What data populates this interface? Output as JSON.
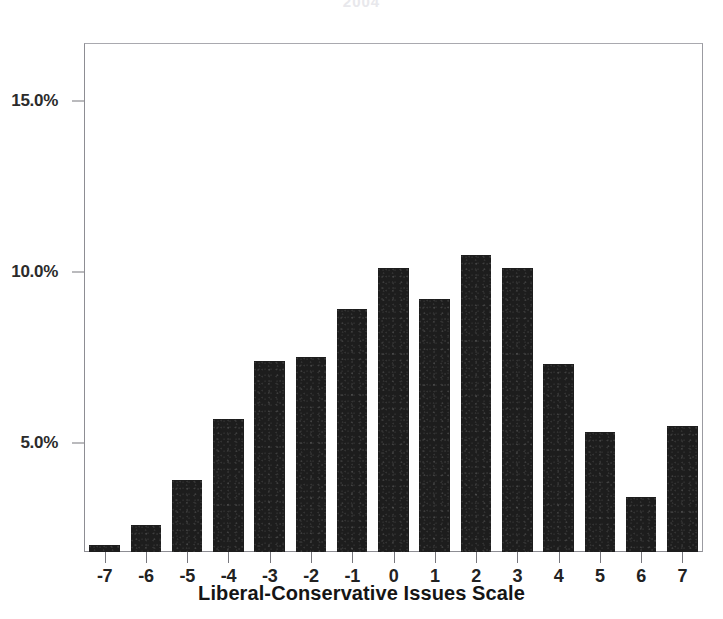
{
  "chart_data": {
    "type": "bar",
    "title": "2004",
    "title_note": "title is cropped off at the top edge of the screenshot and barely legible",
    "xlabel": "Liberal-Conservative Issues Scale",
    "ylabel": "",
    "categories": [
      "-7",
      "-6",
      "-5",
      "-4",
      "-3",
      "-2",
      "-1",
      "0",
      "1",
      "2",
      "3",
      "4",
      "5",
      "6",
      "7"
    ],
    "values": [
      2.0,
      2.6,
      3.9,
      5.7,
      7.4,
      7.5,
      8.9,
      10.1,
      9.2,
      10.5,
      10.1,
      7.3,
      5.3,
      3.4,
      5.5
    ],
    "value_unit": "%",
    "ylim": [
      1.8,
      16.7
    ],
    "y_ticks": [
      5.0,
      10.0,
      15.0
    ],
    "y_tick_labels": [
      "5.0%",
      "10.0%",
      "15.0%"
    ],
    "x_ticks": [
      "-7",
      "-6",
      "-5",
      "-4",
      "-3",
      "-2",
      "-1",
      "0",
      "1",
      "2",
      "3",
      "4",
      "5",
      "6",
      "7"
    ],
    "grid": false,
    "legend": null,
    "bar_color": "#1d1d1d",
    "frame_color": "#8d8d93",
    "background_color": "#ffffff",
    "axis_text_color": "#222222"
  }
}
